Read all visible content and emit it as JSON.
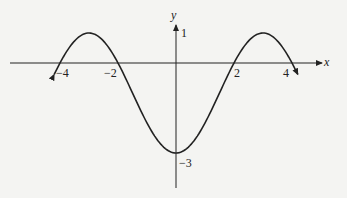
{
  "chart_data": {
    "type": "line",
    "title": "",
    "xlabel": "x",
    "ylabel": "y",
    "function": "y = -1 - 2cos(pi*x/3)",
    "x_ticks": [
      -4,
      -2,
      2,
      4
    ],
    "x_tick_labels": [
      "−4",
      "−2",
      "2",
      "4"
    ],
    "y_ticks": [
      1,
      -3
    ],
    "y_tick_labels": [
      "1",
      "−3"
    ],
    "x": [
      -4.2,
      -3,
      -2,
      0,
      2,
      3,
      4.2
    ],
    "values": [
      0.2,
      1,
      0,
      -3,
      0,
      1,
      0.2
    ],
    "xlim": [
      -5.7,
      5.2
    ],
    "ylim": [
      -4.2,
      1.6
    ],
    "grid": false,
    "legend": "none",
    "curve_ends": "arrows"
  },
  "labels": {
    "x_axis": "x",
    "y_axis": "y",
    "tick_neg4": "−4",
    "tick_neg2": "−2",
    "tick_2": "2",
    "tick_4": "4",
    "tick_y1": "1",
    "tick_yneg3": "−3"
  }
}
